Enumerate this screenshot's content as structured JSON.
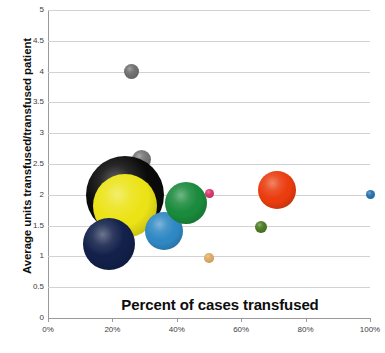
{
  "chart_data": {
    "type": "scatter",
    "title": "",
    "xlabel": "Percent of cases transfused",
    "ylabel": "Average  units transfused/transfused patient",
    "xlim": [
      0,
      100
    ],
    "ylim": [
      0,
      5
    ],
    "grid": true,
    "legend": "none",
    "x_tick_labels": [
      "0%",
      "20%",
      "40%",
      "60%",
      "80%",
      "100%"
    ],
    "x_tick_values": [
      0,
      20,
      40,
      60,
      80,
      100
    ],
    "y_tick_labels": [
      "0",
      "0.5",
      "1",
      "1.5",
      "2",
      "2.5",
      "3",
      "3.5",
      "4",
      "4.5",
      "5"
    ],
    "y_tick_values": [
      0,
      0.5,
      1,
      1.5,
      2,
      2.5,
      3,
      3.5,
      4,
      4.5,
      5
    ],
    "points": [
      {
        "name": "gray-high",
        "x": 26,
        "y": 4.0,
        "r": 7.5,
        "color": "#6e6e6e"
      },
      {
        "name": "gray-cluster",
        "x": 29,
        "y": 2.58,
        "r": 9.5,
        "color": "#747474"
      },
      {
        "name": "black-large",
        "x": 24,
        "y": 2.0,
        "r": 39,
        "color": "#0a0a0a"
      },
      {
        "name": "yellow-large",
        "x": 24,
        "y": 1.82,
        "r": 32,
        "color": "#ece316"
      },
      {
        "name": "navy-large",
        "x": 19,
        "y": 1.2,
        "r": 26,
        "color": "#12204a"
      },
      {
        "name": "lightblue",
        "x": 36,
        "y": 1.42,
        "r": 19,
        "color": "#2f88c4"
      },
      {
        "name": "green-mid",
        "x": 43,
        "y": 1.86,
        "r": 21,
        "color": "#1a8a3c"
      },
      {
        "name": "pink-small",
        "x": 50,
        "y": 2.02,
        "r": 4.5,
        "color": "#d6356b"
      },
      {
        "name": "tan-small",
        "x": 50,
        "y": 0.98,
        "r": 5,
        "color": "#dda860"
      },
      {
        "name": "darkgreen-s",
        "x": 66,
        "y": 1.48,
        "r": 6,
        "color": "#4a7a22"
      },
      {
        "name": "orangered",
        "x": 71,
        "y": 2.08,
        "r": 19,
        "color": "#ea3c0e"
      },
      {
        "name": "blue-small",
        "x": 100,
        "y": 2.0,
        "r": 4.5,
        "color": "#2a6fb0"
      }
    ],
    "colors": {
      "gridline": "#d2d2d2",
      "axis": "#9a9a9a",
      "tick_text": "#3d3d3d",
      "title_text": "#0d0d0d",
      "background": "#ffffff"
    }
  }
}
